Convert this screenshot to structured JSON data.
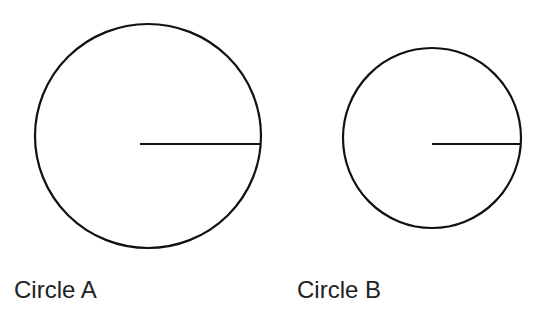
{
  "circles": [
    {
      "label": "Circle A",
      "cx": 148,
      "cy": 136,
      "r": 113,
      "radius_line": {
        "x1": 140,
        "y1": 144,
        "x2": 261,
        "y2": 144
      }
    },
    {
      "label": "Circle B",
      "cx": 432,
      "cy": 138,
      "r": 89,
      "radius_line": {
        "x1": 432,
        "y1": 144,
        "x2": 521,
        "y2": 144
      }
    }
  ],
  "stroke_color": "#111111"
}
